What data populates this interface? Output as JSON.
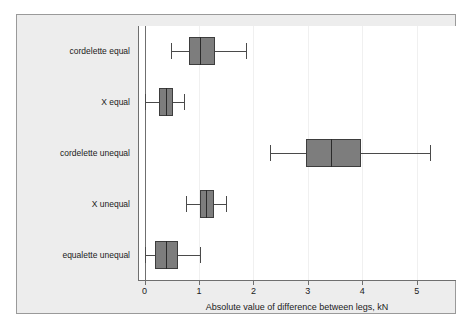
{
  "chart_data": {
    "type": "boxplot",
    "title": "",
    "xlabel": "Absolute value of difference between legs, kN",
    "ylabel": "",
    "xlim": [
      -0.12,
      5.72
    ],
    "xticks": [
      0,
      1,
      2,
      3,
      4,
      5
    ],
    "xticklabels": [
      "0",
      "1",
      "2",
      "3",
      "4",
      "5"
    ],
    "grid": "vertical-light",
    "orientation": "horizontal",
    "legend": "none",
    "box_fill_color": "#7d7d7d",
    "box_edge_color": "#3d3d3d",
    "axis_color": "#6f6f6f",
    "panel_background": "#ededed",
    "plot_background": "#ffffff",
    "categories": [
      "cordelette equal",
      "X equal",
      "cordelette unequal",
      "X unequal",
      "equalette unequal"
    ],
    "boxes": [
      {
        "category": "cordelette equal",
        "whisker_low": 0.48,
        "q1": 0.81,
        "median": 1.01,
        "q3": 1.3,
        "whisker_high": 1.87
      },
      {
        "category": "X equal",
        "whisker_low": 0.0,
        "q1": 0.26,
        "median": 0.4,
        "q3": 0.53,
        "whisker_high": 0.72
      },
      {
        "category": "cordelette unequal",
        "whisker_low": 2.31,
        "q1": 2.97,
        "median": 3.43,
        "q3": 3.98,
        "whisker_high": 5.25
      },
      {
        "category": "X unequal",
        "whisker_low": 0.77,
        "q1": 1.01,
        "median": 1.12,
        "q3": 1.27,
        "whisker_high": 1.5
      },
      {
        "category": "equalette unequal",
        "whisker_low": 0.0,
        "q1": 0.2,
        "median": 0.4,
        "q3": 0.62,
        "whisker_high": 1.01
      }
    ]
  }
}
